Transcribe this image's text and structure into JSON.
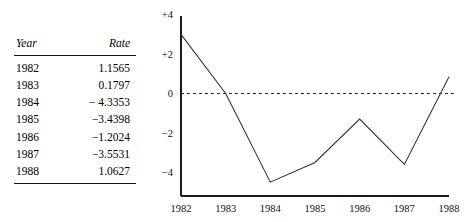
{
  "figure": {
    "name": "rate-table-and-line-chart"
  },
  "table": {
    "name": "rate-table",
    "columns": [
      "Year",
      "Rate"
    ],
    "rows": [
      {
        "year": "1982",
        "rate": "1.1565"
      },
      {
        "year": "1983",
        "rate": "0.1797"
      },
      {
        "year": "1984",
        "rate": "− 4.3353"
      },
      {
        "year": "1985",
        "rate": "−3.4398"
      },
      {
        "year": "1986",
        "rate": "−1.2024"
      },
      {
        "year": "1987",
        "rate": "−3.5531"
      },
      {
        "year": "1988",
        "rate": "1.0627"
      }
    ]
  },
  "chart_data": {
    "type": "line",
    "title": "",
    "subtitle": "",
    "xlabel": "",
    "ylabel": "",
    "categories": [
      "1982",
      "1983",
      "1984",
      "1985",
      "1986",
      "1987",
      "1988"
    ],
    "x": [
      1982,
      1983,
      1984,
      1985,
      1986,
      1987,
      1988
    ],
    "values": [
      3.0,
      0.0,
      -4.5,
      -3.5,
      -1.3,
      -3.6,
      0.85
    ],
    "series": [
      {
        "name": "Rate",
        "values": [
          3.0,
          0.0,
          -4.5,
          -3.5,
          -1.3,
          -3.6,
          0.85
        ]
      }
    ],
    "ylim": [
      -5.0,
      4.2
    ],
    "xlim": [
      1982,
      1988
    ],
    "yticks": [
      4,
      2,
      0,
      -2,
      -4
    ],
    "ytick_labels": [
      "+4",
      "+2",
      "0",
      "−2",
      "−4"
    ],
    "xtick_labels": [
      "1982",
      "1983",
      "1984",
      "1985",
      "1986",
      "1987",
      "1988"
    ],
    "grid": false,
    "legend": false,
    "legend_position": "none",
    "annotations": [
      {
        "label": "zero-reference-line",
        "y": 0,
        "style": "dashed"
      }
    ],
    "line_color": "#303030",
    "axis_color": "#1a1a1a",
    "zero_line_color": "#2a2a2a",
    "background_color": "#ffffff"
  },
  "chart_geometry": {
    "axis_x": 41,
    "axis_bottom": 196,
    "axis_top": 16,
    "axis_right": 309,
    "zero_y": 93.5,
    "y_unit_px": 19.7,
    "x_step_px": 44.67,
    "ytick_y": [
      16,
      54.1,
      93.5,
      132.9,
      172.3
    ],
    "xtick_x": [
      41,
      85.7,
      130.3,
      175.0,
      219.7,
      264.3,
      309
    ],
    "points": "41,36 85.7,93.5 130.3,182 175.0,162.5 219.7,119.1 264.3,164.4 309,76.8"
  }
}
